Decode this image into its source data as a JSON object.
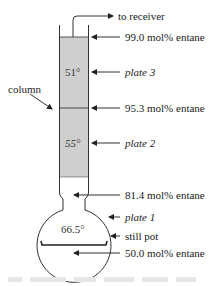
{
  "diagram": {
    "top_arrow_label": "to receiver",
    "column_label": "column",
    "labels": {
      "top_composition": "99.0 mol% entane",
      "plate3": "plate 3",
      "mid_composition": "95.3 mol% entane",
      "plate2": "plate 2",
      "neck_composition": "81.4 mol% entane",
      "plate1": "plate 1",
      "still_pot": "still pot",
      "pot_composition": "50.0 mol% entane"
    },
    "temperatures": {
      "plate3": "51°",
      "plate2": "55°",
      "pot": "66.5°"
    },
    "colors": {
      "column_fill": "#cfcfcf",
      "line": "#333333"
    },
    "caption": "(illegible, faded)"
  }
}
